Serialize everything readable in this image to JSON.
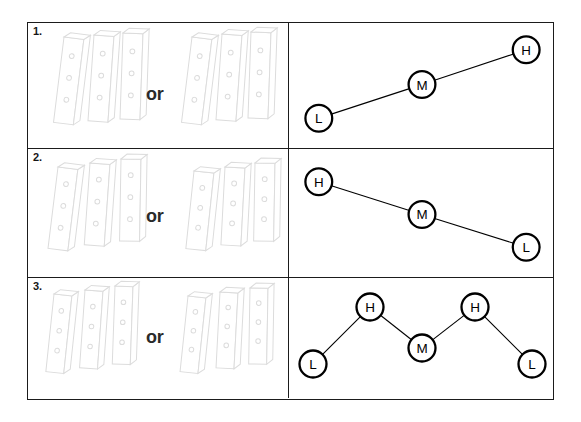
{
  "page": {
    "background_color": "#ffffff",
    "frame_border_color": "#1b1b1b",
    "node_stroke_color": "#000000",
    "illustration_stroke_color": "#dcdcdc",
    "or_text_color": "#2a2a2a"
  },
  "rows": [
    {
      "number": "1.",
      "left": {
        "or_label": "or",
        "group_a_bars": 3,
        "group_b_bars": 3
      },
      "diagram": {
        "type": "node-link",
        "shape": "ascending",
        "nodes": [
          {
            "label": "L",
            "x": 29,
            "y": 96
          },
          {
            "label": "M",
            "x": 133,
            "y": 62
          },
          {
            "label": "H",
            "x": 238,
            "y": 27
          }
        ],
        "edges": [
          [
            0,
            1
          ],
          [
            1,
            2
          ]
        ]
      }
    },
    {
      "number": "2.",
      "left": {
        "or_label": "or",
        "group_a_bars": 3,
        "group_b_bars": 3
      },
      "diagram": {
        "type": "node-link",
        "shape": "descending",
        "nodes": [
          {
            "label": "H",
            "x": 29,
            "y": 33
          },
          {
            "label": "M",
            "x": 133,
            "y": 66
          },
          {
            "label": "L",
            "x": 238,
            "y": 99
          }
        ],
        "edges": [
          [
            0,
            1
          ],
          [
            1,
            2
          ]
        ]
      }
    },
    {
      "number": "3.",
      "left": {
        "or_label": "or",
        "group_a_bars": 3,
        "group_b_bars": 3
      },
      "diagram": {
        "type": "node-link",
        "shape": "zigzag",
        "nodes": [
          {
            "label": "L",
            "x": 24,
            "y": 86
          },
          {
            "label": "H",
            "x": 81,
            "y": 29
          },
          {
            "label": "M",
            "x": 133,
            "y": 70
          },
          {
            "label": "H",
            "x": 186,
            "y": 29
          },
          {
            "label": "L",
            "x": 243,
            "y": 86
          }
        ],
        "edges": [
          [
            0,
            1
          ],
          [
            1,
            2
          ],
          [
            2,
            3
          ],
          [
            3,
            4
          ]
        ]
      }
    }
  ]
}
